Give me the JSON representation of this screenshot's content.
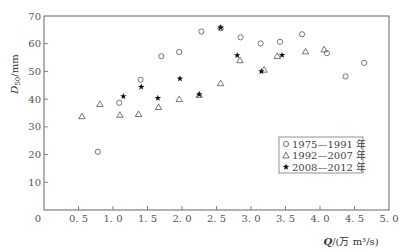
{
  "chart_data": {
    "type": "scatter",
    "title": "",
    "xlabel": "Q/(万 m³/s)",
    "ylabel": "D50/mm",
    "xlim": [
      0,
      5.0
    ],
    "ylim": [
      0,
      70
    ],
    "x_ticks": [
      "0",
      "0.5",
      "1.0",
      "1.5",
      "2.0",
      "2.5",
      "3.0",
      "3.5",
      "4.0",
      "4.5",
      "5.0"
    ],
    "y_ticks": [
      "10",
      "20",
      "30",
      "40",
      "50",
      "60",
      "70"
    ],
    "grid": false,
    "legend_position": "lower right (inside)",
    "series": [
      {
        "name": "1975—1991 年",
        "marker": "circle",
        "points": [
          [
            0.78,
            21.0
          ],
          [
            1.09,
            38.7
          ],
          [
            1.4,
            47.0
          ],
          [
            1.7,
            55.5
          ],
          [
            1.96,
            57.0
          ],
          [
            2.28,
            64.4
          ],
          [
            2.56,
            65.6
          ],
          [
            2.85,
            62.3
          ],
          [
            3.14,
            60.1
          ],
          [
            3.42,
            60.7
          ],
          [
            3.74,
            63.4
          ],
          [
            4.1,
            56.6
          ],
          [
            4.37,
            48.2
          ],
          [
            4.64,
            53.1
          ]
        ]
      },
      {
        "name": "1992—2007 年",
        "marker": "triangle",
        "points": [
          [
            0.55,
            33.8
          ],
          [
            0.81,
            38.2
          ],
          [
            1.1,
            34.3
          ],
          [
            1.37,
            34.6
          ],
          [
            1.66,
            37.1
          ],
          [
            1.96,
            40.0
          ],
          [
            2.25,
            41.5
          ],
          [
            2.56,
            45.7
          ],
          [
            2.84,
            54.0
          ],
          [
            3.19,
            50.6
          ],
          [
            3.38,
            55.5
          ],
          [
            3.79,
            57.2
          ],
          [
            4.06,
            57.9
          ]
        ]
      },
      {
        "name": "2008—2012 年",
        "marker": "star",
        "points": [
          [
            1.15,
            41.0
          ],
          [
            1.41,
            44.4
          ],
          [
            1.65,
            40.4
          ],
          [
            1.97,
            47.4
          ],
          [
            2.25,
            41.7
          ],
          [
            2.56,
            65.8
          ],
          [
            2.8,
            55.8
          ],
          [
            3.15,
            50.0
          ],
          [
            3.45,
            55.9
          ]
        ]
      }
    ]
  },
  "labels": {
    "ylabel_main": "D",
    "ylabel_sub": "50",
    "ylabel_unit": "/mm",
    "xlabel_q": "Q",
    "xlabel_unit": "/(万 m³/s)",
    "origin": "0"
  },
  "legend": [
    {
      "symbol": "○",
      "label": "1975—1991 年"
    },
    {
      "symbol": "△",
      "label": "1992—2007 年"
    },
    {
      "symbol": "★",
      "label": "2008—2012 年"
    }
  ]
}
